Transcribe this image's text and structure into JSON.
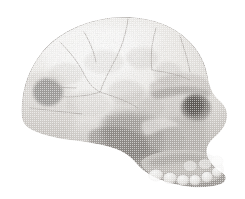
{
  "figure": {
    "view": "right lateral view",
    "medium": "halftone screened monochrome print illustration",
    "caption": "",
    "background_color": "#ffffff",
    "canvas": {
      "width": 245,
      "height": 199
    }
  },
  "palette": {
    "background": "#ffffff",
    "bone_highlight": "#f4f3f1",
    "bone_light": "#e4e2df",
    "bone_mid": "#c9c6c2",
    "bone_shadow": "#a8a4a0",
    "deep_shadow": "#807c78",
    "darkest_orbit": "#6a6662",
    "outline": "#9a9692",
    "suture_line": "#b5b1ad",
    "tooth_enamel": "#efeeec",
    "tooth_edge": "#b9b5b1"
  },
  "anatomy": {
    "regions": [
      {
        "id": "cranial-vault",
        "label": "Cranial vault (frontal, parietal)",
        "tone": "#e9e7e4"
      },
      {
        "id": "occipital-region",
        "label": "Occipital region",
        "tone": "#ddd9d5"
      },
      {
        "id": "supraorbital-torus",
        "label": "Supraorbital torus (brow ridge)",
        "tone": "#cfcbc7"
      },
      {
        "id": "orbit",
        "label": "Orbit (eye socket)",
        "tone": "#6f6b67"
      },
      {
        "id": "nasal-aperture",
        "label": "Nasal aperture region",
        "tone": "#b4b0ac"
      },
      {
        "id": "zygomatic-arch",
        "label": "Zygomatic arch",
        "tone": "#c6c2be"
      },
      {
        "id": "temporal-fossa",
        "label": "Temporal fossa",
        "tone": "#9e9a96"
      },
      {
        "id": "maxilla",
        "label": "Maxilla",
        "tone": "#cbc7c3"
      },
      {
        "id": "tooth-row",
        "label": "Maxillary tooth row",
        "tone": "#eeedeb"
      },
      {
        "id": "cranial-base",
        "label": "Cranial base",
        "tone": "#9b9793"
      }
    ],
    "sutures": [
      {
        "id": "coronal-suture",
        "label": "Coronal suture"
      },
      {
        "id": "sagittal-region-crack",
        "label": "Vault fracture line"
      },
      {
        "id": "lambdoid-suture",
        "label": "Lambdoid suture"
      },
      {
        "id": "squamosal-suture",
        "label": "Squamosal suture"
      }
    ],
    "teeth": [
      {
        "id": "tooth-m2",
        "label": "Second molar"
      },
      {
        "id": "tooth-m1",
        "label": "First molar"
      },
      {
        "id": "tooth-pm2",
        "label": "Second premolar"
      },
      {
        "id": "tooth-pm1",
        "label": "First premolar"
      },
      {
        "id": "tooth-canine",
        "label": "Canine"
      },
      {
        "id": "tooth-incisor",
        "label": "Incisor"
      }
    ]
  }
}
